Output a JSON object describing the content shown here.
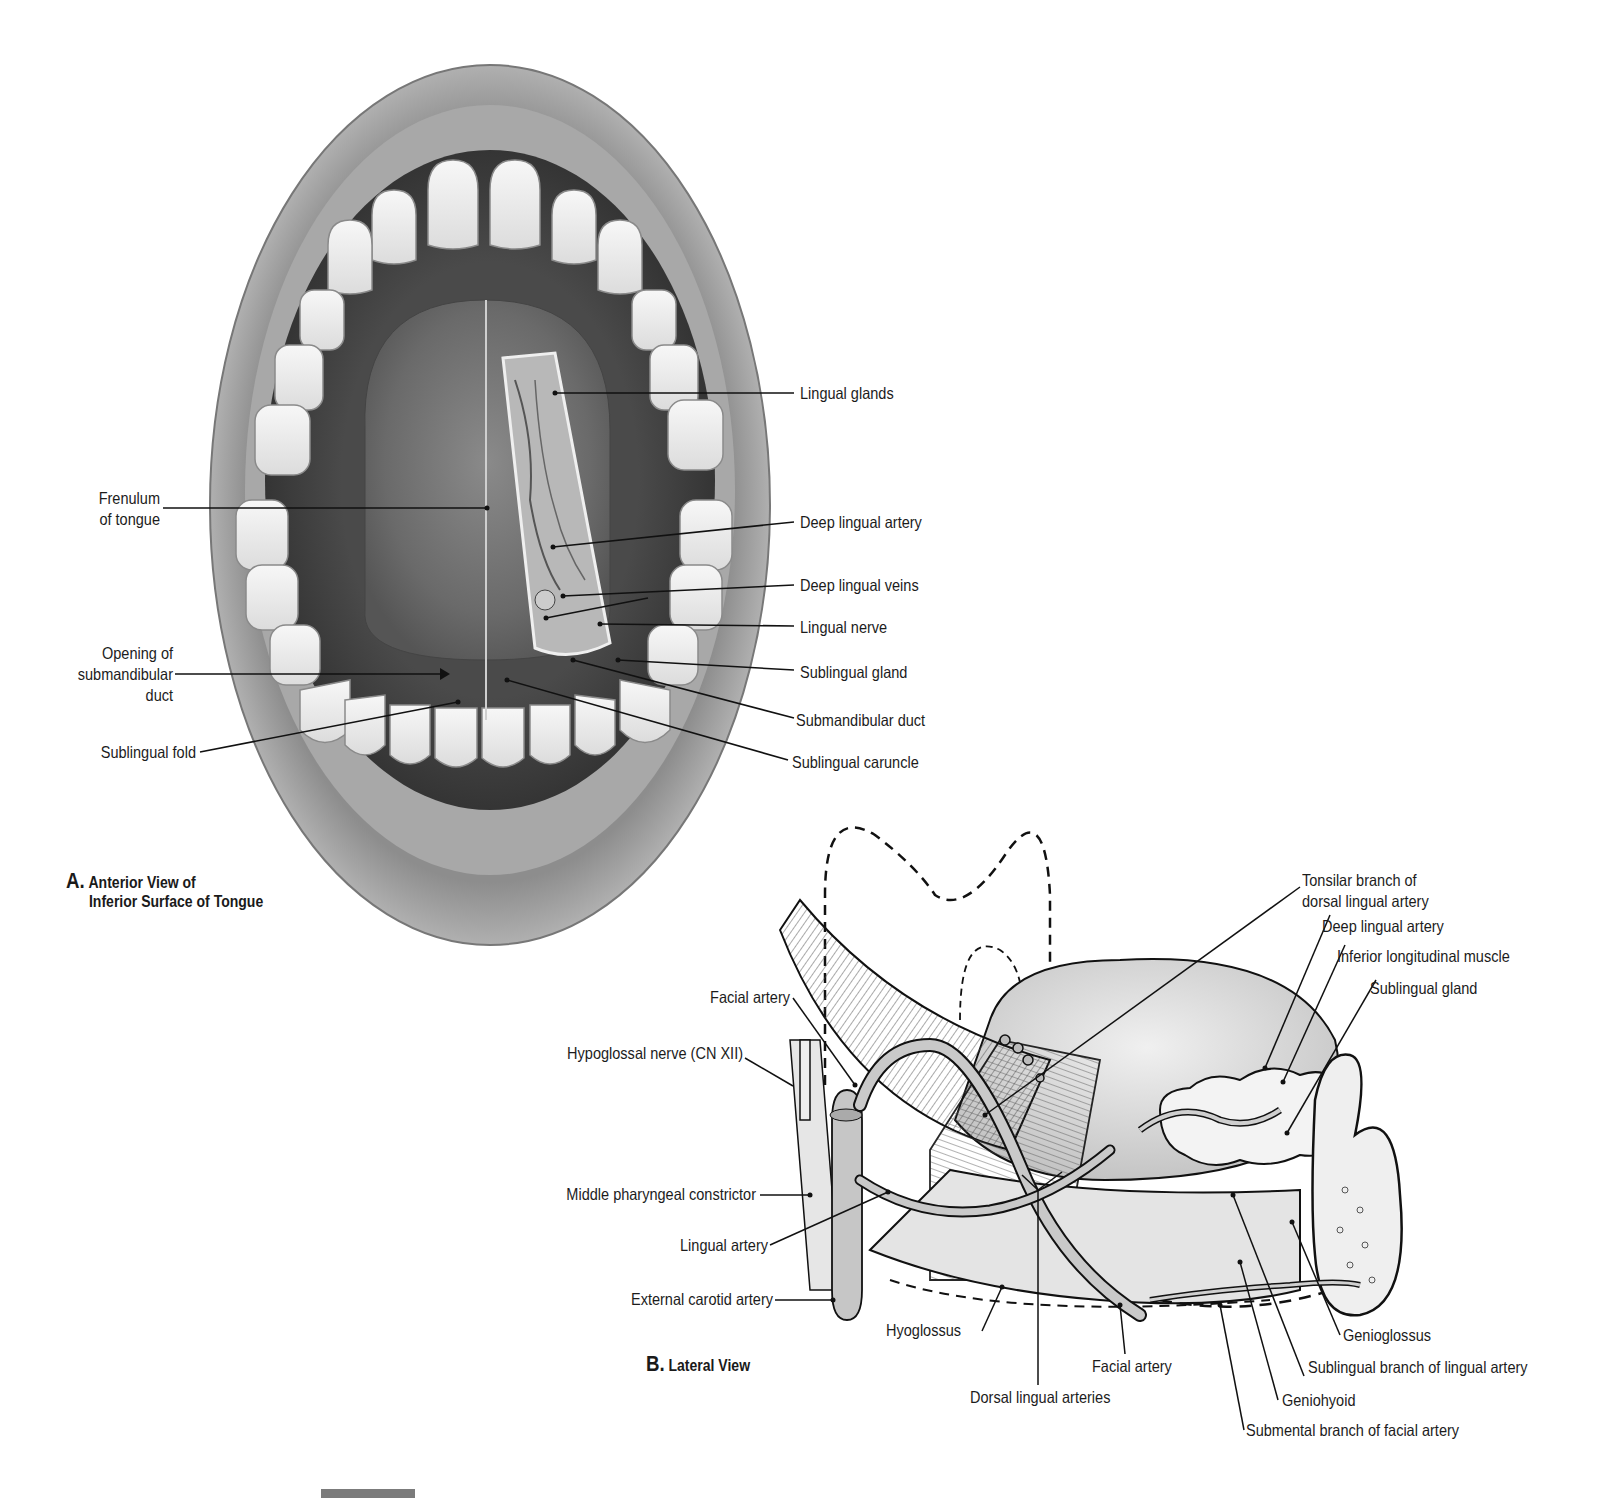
{
  "figure": {
    "panel_a": {
      "caption_letter": "A.",
      "caption_line1": "Anterior View of",
      "caption_line2": "Inferior Surface of Tongue",
      "labels_left": {
        "frenulum_1": "Frenulum",
        "frenulum_2": "of tongue",
        "opening_1": "Opening of",
        "opening_2": "submandibular",
        "opening_3": "duct",
        "sublingual_fold": "Sublingual fold"
      },
      "labels_right": {
        "lingual_glands": "Lingual glands",
        "deep_lingual_artery": "Deep lingual artery",
        "deep_lingual_veins": "Deep lingual veins",
        "lingual_nerve": "Lingual nerve",
        "sublingual_gland": "Sublingual gland",
        "submandibular_duct": "Submandibular duct",
        "sublingual_caruncle": "Sublingual caruncle"
      }
    },
    "panel_b": {
      "caption_letter": "B.",
      "caption_text": "Lateral View",
      "labels": {
        "tonsilar_1": "Tonsilar branch of",
        "tonsilar_2": "dorsal lingual artery",
        "deep_lingual_artery": "Deep lingual artery",
        "inferior_longitudinal": "Inferior longitudinal muscle",
        "sublingual_gland": "Sublingual gland",
        "facial_artery_top": "Facial artery",
        "hypoglossal_nerve": "Hypoglossal nerve (CN XII)",
        "middle_pharyngeal": "Middle pharyngeal constrictor",
        "lingual_artery": "Lingual artery",
        "external_carotid": "External carotid artery",
        "hyoglossus": "Hyoglossus",
        "facial_artery_bottom": "Facial artery",
        "dorsal_lingual_arteries": "Dorsal lingual arteries",
        "genioglossus": "Genioglossus",
        "sublingual_branch": "Sublingual branch of lingual artery",
        "geniohyoid": "Geniohyoid",
        "submental_branch": "Submental branch of facial artery"
      }
    }
  }
}
